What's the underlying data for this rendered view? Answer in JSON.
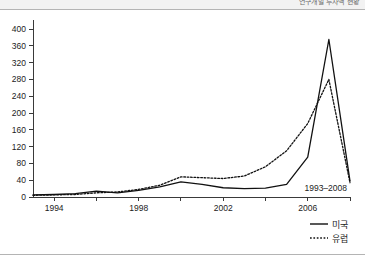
{
  "header": {
    "title": "연구개발 투자액 현황"
  },
  "chart_data": {
    "type": "line",
    "title": "",
    "subtitle": "",
    "xlabel": "",
    "ylabel": "",
    "annotation": "1993–2008",
    "xlim": [
      1993,
      2008
    ],
    "ylim": [
      0,
      400
    ],
    "ytick_step": 40,
    "yticks": [
      0,
      40,
      80,
      120,
      160,
      200,
      240,
      280,
      320,
      360,
      400
    ],
    "xticks": [
      1994,
      1998,
      2002,
      2006
    ],
    "xtick_labels": [
      "1994",
      "1998",
      "2002",
      "2006"
    ],
    "minor_xticks": [
      1994,
      1995,
      1996,
      1997,
      1998,
      1999,
      2000,
      2001,
      2002,
      2003,
      2004,
      2005,
      2006,
      2007,
      2008
    ],
    "grid": false,
    "legend_position": "bottom-right",
    "x": [
      1993,
      1994,
      1995,
      1996,
      1997,
      1998,
      1999,
      2000,
      2001,
      2002,
      2003,
      2004,
      2005,
      2006,
      2007,
      2008
    ],
    "series": [
      {
        "name": "미국",
        "style": "solid",
        "color": "#111111",
        "values": [
          5,
          6,
          8,
          14,
          10,
          16,
          24,
          36,
          30,
          22,
          20,
          21,
          30,
          95,
          375,
          38
        ]
      },
      {
        "name": "유럽",
        "style": "dotted",
        "color": "#111111",
        "values": [
          4,
          5,
          6,
          10,
          12,
          18,
          28,
          48,
          46,
          44,
          50,
          72,
          110,
          175,
          280,
          34
        ]
      }
    ]
  },
  "legend": {
    "items": [
      {
        "label": "미국",
        "style": "solid"
      },
      {
        "label": "유럽",
        "style": "dotted"
      }
    ]
  }
}
